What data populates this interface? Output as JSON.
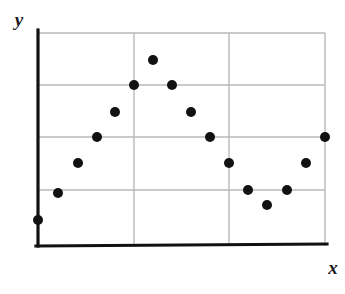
{
  "chart_data": {
    "type": "scatter",
    "title": "",
    "subtitle": "",
    "xlabel": "x",
    "ylabel": "y",
    "xlim": [
      0,
      18
    ],
    "ylim": [
      0,
      9
    ],
    "grid": true,
    "grid_x_values": [
      6,
      12
    ],
    "grid_y_values": [
      2,
      4,
      6
    ],
    "legend": null,
    "legend_position": "none",
    "axis_tick_labels": {
      "x": [],
      "y": []
    },
    "annotations": [],
    "marker": {
      "shape": "circle",
      "color": "#111111",
      "radius_px": 5
    },
    "series": [
      {
        "name": "data",
        "points": [
          {
            "x": 0,
            "y": 1.0
          },
          {
            "x": 1,
            "y": 1.5
          },
          {
            "x": 2,
            "y": 2.1
          },
          {
            "x": 3,
            "y": 2.6
          },
          {
            "x": 4,
            "y": 3.1
          },
          {
            "x": 5,
            "y": 3.6
          },
          {
            "x": 6,
            "y": 4.1
          },
          {
            "x": 7,
            "y": 4.6
          },
          {
            "x": 8,
            "y": 5.6
          },
          {
            "x": 9,
            "y": 6.5
          },
          {
            "x": 10,
            "y": 5.6
          },
          {
            "x": 11,
            "y": 4.6
          },
          {
            "x": 12,
            "y": 4.1
          },
          {
            "x": 13,
            "y": 3.1
          },
          {
            "x": 14,
            "y": 2.1
          },
          {
            "x": 15,
            "y": 1.6
          },
          {
            "x": 16,
            "y": 2.1
          },
          {
            "x": 17,
            "y": 3.1
          },
          {
            "x": 18,
            "y": 4.1
          }
        ],
        "pixel_points": [
          {
            "px": 38,
            "py": 220
          },
          {
            "px": 58,
            "py": 193
          },
          {
            "px": 78,
            "py": 163
          },
          {
            "px": 97,
            "py": 137
          },
          {
            "px": 115,
            "py": 112
          },
          {
            "px": 134,
            "py": 85
          },
          {
            "px": 153,
            "py": 60
          },
          {
            "px": 172,
            "py": 85
          },
          {
            "px": 191,
            "py": 112
          },
          {
            "px": 210,
            "py": 137
          },
          {
            "px": 229,
            "py": 163
          },
          {
            "px": 248,
            "py": 190
          },
          {
            "px": 267,
            "py": 205
          },
          {
            "px": 287,
            "py": 190
          },
          {
            "px": 306,
            "py": 163
          },
          {
            "px": 325,
            "py": 137
          }
        ]
      }
    ],
    "geometry": {
      "plot_left": 38,
      "plot_right": 325,
      "plot_top": 33,
      "plot_bottom": 246,
      "vertical_gridlines_px": [
        134,
        229
      ],
      "horizontal_gridlines_px": [
        85,
        137,
        190
      ]
    },
    "colors": {
      "axis": "#111111",
      "grid": "#b9b9b9",
      "frame": "#b9b9b9",
      "marker": "#111111",
      "background": "#ffffff",
      "label": "#1a1a1a"
    }
  }
}
